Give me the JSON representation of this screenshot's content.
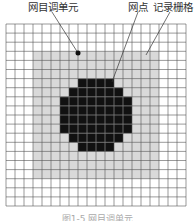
{
  "labels": {
    "halftone_cell": "网目调单元",
    "dot": "网点",
    "recording_grid": "记录栅格"
  },
  "caption": "图1-5 网目调单元",
  "colors": {
    "grid_line": "#555555",
    "gray_fill": "#d9d9d9",
    "black_fill": "#111111",
    "background": "#ffffff"
  },
  "grid": {
    "columns": 20,
    "rows": 20,
    "origin_x": 6,
    "origin_y": 24,
    "cell_w": 9,
    "cell_h": 9.1,
    "gray_region": {
      "col_start": 3,
      "col_end": 16,
      "row_start": 3,
      "row_end": 16
    },
    "black_rows": [
      {
        "row": 6,
        "col_start": 8,
        "col_end": 11
      },
      {
        "row": 7,
        "col_start": 7,
        "col_end": 12
      },
      {
        "row": 8,
        "col_start": 6,
        "col_end": 13
      },
      {
        "row": 9,
        "col_start": 6,
        "col_end": 13
      },
      {
        "row": 10,
        "col_start": 6,
        "col_end": 13
      },
      {
        "row": 11,
        "col_start": 6,
        "col_end": 13
      },
      {
        "row": 12,
        "col_start": 7,
        "col_end": 12
      },
      {
        "row": 13,
        "col_start": 8,
        "col_end": 11
      }
    ]
  },
  "leaders": [
    {
      "name": "halftone-cell-leader",
      "x1": 52,
      "y1": 12,
      "x2": 78,
      "y2": 53,
      "dot": true
    },
    {
      "name": "dot-leader",
      "x1": 138,
      "y1": 12,
      "x2": 112,
      "y2": 82,
      "dot": false
    },
    {
      "name": "recording-grid-leader",
      "x1": 170,
      "y1": 12,
      "x2": 146,
      "y2": 55,
      "dot": false
    }
  ]
}
